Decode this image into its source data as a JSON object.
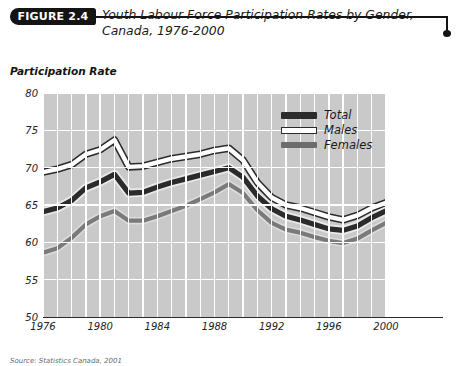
{
  "figure": {
    "badge": "FIGURE 2.4",
    "title": "Youth Labour Force Participation Rates by Gender, Canada, 1976-2000",
    "source": "Source: Statistics Canada, 2001"
  },
  "axis": {
    "ylabel": "Participation Rate"
  },
  "legend": {
    "items": [
      {
        "label": "Total",
        "color": "#2b2b2b"
      },
      {
        "label": "Males",
        "color": "#ffffff"
      },
      {
        "label": "Females",
        "color": "#6d6d6d"
      }
    ]
  },
  "chart_data": {
    "type": "line",
    "title": "Youth Labour Force Participation Rates by Gender, Canada, 1976-2000",
    "xlabel": "",
    "ylabel": "Participation Rate",
    "xlim": [
      1976,
      2000
    ],
    "ylim": [
      50,
      80
    ],
    "yticks": [
      50,
      55,
      60,
      65,
      70,
      75,
      80
    ],
    "xticks": [
      1976,
      1980,
      1984,
      1988,
      1992,
      1996,
      2000
    ],
    "grid": true,
    "legend_position": "top-right",
    "x": [
      1976,
      1977,
      1978,
      1979,
      1980,
      1981,
      1982,
      1983,
      1984,
      1985,
      1986,
      1987,
      1988,
      1989,
      1990,
      1991,
      1992,
      1993,
      1994,
      1995,
      1996,
      1997,
      1998,
      1999,
      2000
    ],
    "series": [
      {
        "name": "Males",
        "color": "#ffffff",
        "values": [
          69.4,
          69.8,
          70.4,
          71.8,
          72.4,
          73.7,
          70.1,
          70.2,
          70.7,
          71.2,
          71.5,
          71.8,
          72.3,
          72.6,
          71.0,
          68.0,
          66.0,
          65.0,
          64.6,
          64.0,
          63.4,
          63.0,
          63.6,
          64.6,
          65.3
        ]
      },
      {
        "name": "Total",
        "color": "#2b2b2b",
        "values": [
          64.1,
          64.6,
          65.6,
          67.3,
          68.1,
          69.1,
          66.6,
          66.7,
          67.4,
          68.0,
          68.5,
          69.0,
          69.5,
          70.0,
          68.7,
          66.2,
          64.5,
          63.5,
          63.0,
          62.4,
          61.8,
          61.6,
          62.2,
          63.3,
          64.2
        ]
      },
      {
        "name": "Females",
        "color": "#6d6d6d",
        "values": [
          58.6,
          59.2,
          60.6,
          62.4,
          63.5,
          64.2,
          62.9,
          62.9,
          63.5,
          64.2,
          64.9,
          65.8,
          66.7,
          67.8,
          66.6,
          64.3,
          62.6,
          61.7,
          61.3,
          60.7,
          60.2,
          59.9,
          60.5,
          61.6,
          62.6
        ]
      }
    ]
  }
}
